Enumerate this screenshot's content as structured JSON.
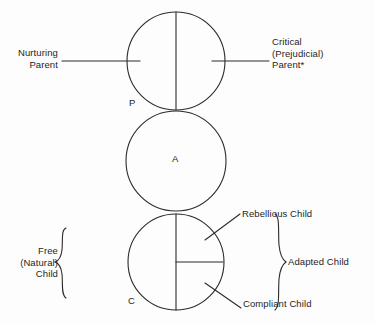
{
  "figure": {
    "line_color": "#2b2b2b",
    "text_color": "#1d1d1d",
    "background": "#fdfdfd"
  },
  "ego_states": {
    "parent": {
      "letter": "P",
      "name": "Parent"
    },
    "adult": {
      "letter": "A",
      "name": "Adult"
    },
    "child": {
      "letter": "C",
      "name": "Child"
    }
  },
  "labels": {
    "nurturing_parent": "Nurturing\nParent",
    "critical_parent": "Critical\n(Prejudicial)\nParent*",
    "free_child": "Free\n(Natural)\nChild",
    "rebellious_child": "Rebellious Child",
    "adapted_child": "Adapted Child",
    "compliant_child": "Compliant Child"
  },
  "diagram_data": {
    "type": "diagram",
    "description": "Transactional Analysis second-order structural diagram of three stacked ego-state circles, Parent over Adult over Child, with subdivision labels.",
    "circles": [
      {
        "id": "parent",
        "letter": "P",
        "center_x": 176,
        "center_y": 61,
        "radius": 49,
        "divisions": [
          "vertical-diameter"
        ],
        "sectors": [
          "Nurturing Parent",
          "Critical (Prejudicial) Parent*"
        ]
      },
      {
        "id": "adult",
        "letter": "A",
        "center_x": 176,
        "center_y": 161,
        "radius": 50,
        "divisions": [],
        "sectors": []
      },
      {
        "id": "child",
        "letter": "C",
        "center_x": 176,
        "center_y": 262,
        "radius": 48,
        "divisions": [
          "vertical-diameter",
          "right-horizontal-radius"
        ],
        "sectors": [
          "Free (Natural) Child",
          "Rebellious Child",
          "Compliant Child"
        ]
      }
    ],
    "braces": [
      {
        "id": "free-child-brace",
        "side": "left",
        "label": "Free (Natural) Child"
      },
      {
        "id": "adapted-child-brace",
        "side": "right",
        "label": "Adapted Child"
      }
    ],
    "footnote_marker": "*"
  }
}
